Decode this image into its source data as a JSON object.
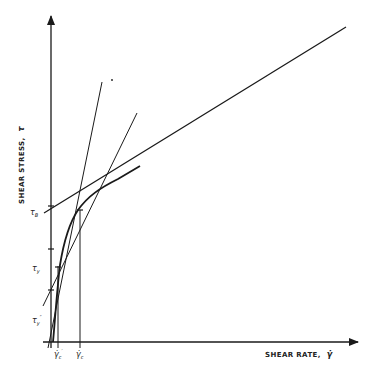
{
  "diagram": {
    "type": "rheology-flow-curve",
    "y_axis": {
      "label": "SHEAR STRESS,",
      "symbol": "τ"
    },
    "x_axis": {
      "label": "SHEAR RATE,",
      "symbol": "γ̇"
    },
    "y_markers": [
      {
        "symbol": "τ",
        "sub": "B"
      },
      {
        "symbol": "τ",
        "sub": "y"
      },
      {
        "symbol": "τ",
        "sub": "y",
        "sup": "″"
      }
    ],
    "x_markers": [
      {
        "symbol": "γ̇",
        "sub": "c",
        "sup": "′"
      },
      {
        "symbol": "γ̇",
        "sub": "c"
      }
    ],
    "colors": {
      "ink": "#1a1a1a",
      "background": "#ffffff"
    }
  }
}
